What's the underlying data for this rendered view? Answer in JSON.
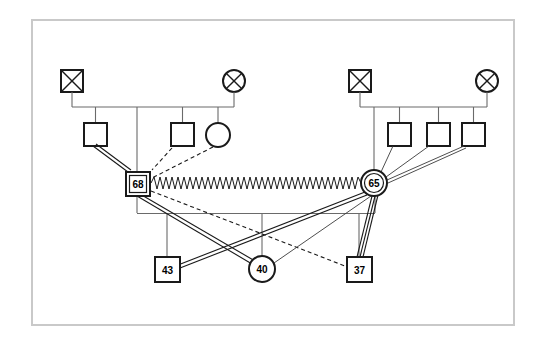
{
  "diagram": {
    "type": "pedigree-genogram",
    "canvas": {
      "width": 546,
      "height": 345,
      "background": "#ffffff"
    },
    "frame": {
      "x": 31,
      "y": 19,
      "width": 484,
      "height": 307,
      "stroke": "#c9c9c9",
      "stroke_width": 2
    },
    "stroke_color": "#1a1a1a",
    "line_color": "#555555"
  },
  "families": [
    {
      "id": "family-left",
      "name": "left-family",
      "father": {
        "name": "deceased-male-grandfather-left",
        "shape": "square-crossed",
        "x": 61,
        "y": 70,
        "size": 22
      },
      "mother": {
        "name": "deceased-female-grandmother-left",
        "shape": "circle-crossed",
        "cx": 234,
        "cy": 81,
        "r": 11
      },
      "sibling_bar_y": 107,
      "children": [
        {
          "name": "male-child-left-1",
          "shape": "square",
          "x": 84,
          "y": 123,
          "size": 23
        },
        {
          "name": "male-child-left-2",
          "shape": "square",
          "x": 171,
          "y": 123,
          "size": 23
        },
        {
          "name": "female-child-left-3",
          "shape": "circle",
          "cx": 218,
          "cy": 135,
          "r": 12
        }
      ]
    },
    {
      "id": "family-right",
      "name": "right-family",
      "father": {
        "name": "deceased-male-grandfather-right",
        "shape": "square-crossed",
        "x": 349,
        "y": 70,
        "size": 22
      },
      "mother": {
        "name": "deceased-female-grandmother-right",
        "shape": "circle-crossed",
        "cx": 487,
        "cy": 81,
        "r": 11
      },
      "sibling_bar_y": 107,
      "children": [
        {
          "name": "male-child-right-1",
          "shape": "square",
          "x": 388,
          "y": 123,
          "size": 23
        },
        {
          "name": "male-child-right-2",
          "shape": "square",
          "x": 427,
          "y": 123,
          "size": 23
        },
        {
          "name": "male-child-right-3",
          "shape": "square",
          "x": 462,
          "y": 123,
          "size": 23
        }
      ]
    }
  ],
  "index_nodes": [
    {
      "id": "n68",
      "name": "index-male-68",
      "label": "68",
      "shape": "double-square",
      "x": 126,
      "y": 172,
      "size": 24
    },
    {
      "id": "n65",
      "name": "index-female-65",
      "label": "65",
      "shape": "double-circle",
      "cx": 374,
      "cy": 183,
      "r": 13
    }
  ],
  "offspring_nodes": [
    {
      "id": "n43",
      "name": "offspring-male-43",
      "label": "43",
      "shape": "square",
      "x": 155,
      "y": 257,
      "size": 25
    },
    {
      "id": "n40",
      "name": "offspring-female-40",
      "label": "40",
      "shape": "circle",
      "cx": 262,
      "cy": 269,
      "r": 13
    },
    {
      "id": "n37",
      "name": "offspring-male-37",
      "label": "37",
      "shape": "square",
      "x": 347,
      "y": 257,
      "size": 25
    }
  ],
  "sibling_bar": {
    "name": "offspring-sibling-bar",
    "y": 213,
    "x1": 137,
    "x2": 375
  },
  "relationships": [
    {
      "name": "conflict-link-68-65",
      "style": "zigzag",
      "from": "68",
      "to": "65",
      "y": 183,
      "x1": 151,
      "x2": 362
    },
    {
      "name": "close-link-68-child1",
      "style": "double-solid",
      "from": "child-left-1",
      "to": "68"
    },
    {
      "name": "distant-link-68-child2",
      "style": "dashed",
      "from": "child-left-2",
      "to": "68"
    },
    {
      "name": "distant-link-68-child3",
      "style": "dashed",
      "from": "child-left-3",
      "to": "68"
    },
    {
      "name": "close-link-68-43",
      "style": "double-solid",
      "from": "68",
      "to": "43"
    },
    {
      "name": "close-link-68-40",
      "style": "double-solid",
      "from": "68",
      "to": "40"
    },
    {
      "name": "distant-link-68-37",
      "style": "dashed",
      "from": "68",
      "to": "37"
    },
    {
      "name": "thin-link-65-child-right-1",
      "style": "thin-solid",
      "from": "child-right-1",
      "to": "65"
    },
    {
      "name": "thin-link-65-child-right-2",
      "style": "thin-solid",
      "from": "child-right-2",
      "to": "65"
    },
    {
      "name": "thin-link-65-child-right-3",
      "style": "thin-solid",
      "from": "child-right-3",
      "to": "65"
    },
    {
      "name": "close-link-65-43",
      "style": "double-solid",
      "from": "65",
      "to": "43"
    },
    {
      "name": "thin-link-65-40",
      "style": "thin-solid",
      "from": "65",
      "to": "40"
    },
    {
      "name": "close-link-65-37",
      "style": "double-solid",
      "from": "65",
      "to": "37"
    }
  ],
  "legend": {
    "symbols": {
      "square": "male",
      "circle": "female",
      "crossed": "deceased",
      "double-border": "index-person",
      "zigzag": "conflictual-relationship",
      "double-line": "close-relationship",
      "dashed-line": "distant-relationship"
    }
  }
}
